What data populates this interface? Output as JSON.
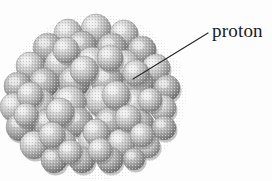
{
  "figure": {
    "name": "atomic-nucleus-illustration",
    "render_style": "shaded-sphere-cluster",
    "background_color": "#fdfdfd",
    "sphere_base_color": "#b9b9b9",
    "sphere_highlight_color": "#f2f2f2",
    "sphere_shadow_color": "#6e6e6e",
    "sphere_edge_color": "#8a8a8a",
    "cluster": {
      "center_x": 96,
      "center_y": 97,
      "radius_x": 88,
      "radius_y": 80,
      "sphere_count": 54,
      "sphere_radius": 15
    },
    "spheres": [
      {
        "cx": 96,
        "cy": 29,
        "r": 15,
        "depth": 0
      },
      {
        "cx": 68,
        "cy": 33,
        "r": 14,
        "depth": 0
      },
      {
        "cx": 124,
        "cy": 34,
        "r": 14,
        "depth": 0
      },
      {
        "cx": 48,
        "cy": 48,
        "r": 15,
        "depth": 1
      },
      {
        "cx": 82,
        "cy": 46,
        "r": 15,
        "depth": 1
      },
      {
        "cx": 112,
        "cy": 48,
        "r": 15,
        "depth": 1
      },
      {
        "cx": 142,
        "cy": 50,
        "r": 14,
        "depth": 1
      },
      {
        "cx": 30,
        "cy": 66,
        "r": 14,
        "depth": 2
      },
      {
        "cx": 60,
        "cy": 64,
        "r": 15,
        "depth": 2
      },
      {
        "cx": 92,
        "cy": 63,
        "r": 16,
        "depth": 2
      },
      {
        "cx": 125,
        "cy": 65,
        "r": 15,
        "depth": 2
      },
      {
        "cx": 156,
        "cy": 68,
        "r": 14,
        "depth": 2
      },
      {
        "cx": 18,
        "cy": 86,
        "r": 14,
        "depth": 3
      },
      {
        "cx": 44,
        "cy": 83,
        "r": 15,
        "depth": 3
      },
      {
        "cx": 74,
        "cy": 82,
        "r": 16,
        "depth": 3
      },
      {
        "cx": 107,
        "cy": 81,
        "r": 16,
        "depth": 3
      },
      {
        "cx": 139,
        "cy": 84,
        "r": 15,
        "depth": 3
      },
      {
        "cx": 167,
        "cy": 88,
        "r": 13,
        "depth": 3
      },
      {
        "cx": 14,
        "cy": 107,
        "r": 14,
        "depth": 4
      },
      {
        "cx": 40,
        "cy": 104,
        "r": 15,
        "depth": 4
      },
      {
        "cx": 70,
        "cy": 102,
        "r": 16,
        "depth": 4
      },
      {
        "cx": 102,
        "cy": 101,
        "r": 16,
        "depth": 4
      },
      {
        "cx": 134,
        "cy": 104,
        "r": 15,
        "depth": 4
      },
      {
        "cx": 163,
        "cy": 108,
        "r": 13,
        "depth": 4
      },
      {
        "cx": 20,
        "cy": 127,
        "r": 14,
        "depth": 5
      },
      {
        "cx": 48,
        "cy": 124,
        "r": 15,
        "depth": 5
      },
      {
        "cx": 78,
        "cy": 122,
        "r": 15,
        "depth": 5
      },
      {
        "cx": 110,
        "cy": 122,
        "r": 15,
        "depth": 5
      },
      {
        "cx": 140,
        "cy": 124,
        "r": 14,
        "depth": 5
      },
      {
        "cx": 164,
        "cy": 128,
        "r": 12,
        "depth": 5
      },
      {
        "cx": 34,
        "cy": 145,
        "r": 14,
        "depth": 6
      },
      {
        "cx": 62,
        "cy": 143,
        "r": 14,
        "depth": 6
      },
      {
        "cx": 92,
        "cy": 142,
        "r": 14,
        "depth": 6
      },
      {
        "cx": 121,
        "cy": 143,
        "r": 14,
        "depth": 6
      },
      {
        "cx": 148,
        "cy": 146,
        "r": 12,
        "depth": 6
      },
      {
        "cx": 54,
        "cy": 160,
        "r": 13,
        "depth": 7
      },
      {
        "cx": 82,
        "cy": 160,
        "r": 13,
        "depth": 7
      },
      {
        "cx": 110,
        "cy": 160,
        "r": 13,
        "depth": 7
      },
      {
        "cx": 134,
        "cy": 159,
        "r": 11,
        "depth": 7
      },
      {
        "cx": 84,
        "cy": 70,
        "r": 14,
        "depth": 8
      },
      {
        "cx": 116,
        "cy": 95,
        "r": 14,
        "depth": 8
      },
      {
        "cx": 60,
        "cy": 112,
        "r": 14,
        "depth": 8
      },
      {
        "cx": 96,
        "cy": 132,
        "r": 13,
        "depth": 8
      },
      {
        "cx": 30,
        "cy": 95,
        "r": 13,
        "depth": 8
      },
      {
        "cx": 150,
        "cy": 100,
        "r": 12,
        "depth": 8
      },
      {
        "cx": 128,
        "cy": 118,
        "r": 13,
        "depth": 8
      },
      {
        "cx": 52,
        "cy": 135,
        "r": 13,
        "depth": 8
      },
      {
        "cx": 70,
        "cy": 152,
        "r": 12,
        "depth": 8
      },
      {
        "cx": 100,
        "cy": 150,
        "r": 12,
        "depth": 8
      },
      {
        "cx": 142,
        "cy": 135,
        "r": 12,
        "depth": 8
      },
      {
        "cx": 26,
        "cy": 115,
        "r": 12,
        "depth": 8
      },
      {
        "cx": 110,
        "cy": 58,
        "r": 13,
        "depth": 8
      },
      {
        "cx": 66,
        "cy": 50,
        "r": 13,
        "depth": 8
      },
      {
        "cx": 136,
        "cy": 73,
        "r": 13,
        "depth": 8
      }
    ],
    "callout": {
      "label": "proton",
      "label_color": "#1b1b1b",
      "leader_line_color": "#2a2a2a",
      "leader_line_width": 1.2,
      "leader_from_x": 208,
      "leader_from_y": 33,
      "leader_to_x": 133,
      "leader_to_y": 79,
      "target_sphere": {
        "cx": 122,
        "cy": 92,
        "r": 16
      }
    }
  }
}
